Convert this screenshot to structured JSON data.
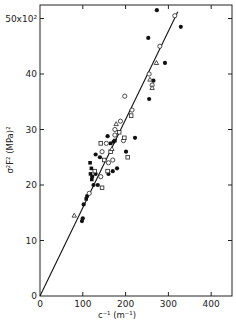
{
  "chart_data": {
    "type": "scatter",
    "title": "",
    "xlabel": "c⁻¹  (m⁻¹)",
    "ylabel": "σ²F²  (MPa)²",
    "y_multiplier_label": "50×10²",
    "xlim": [
      0,
      450
    ],
    "ylim": [
      0,
      52
    ],
    "x_ticks": [
      0,
      100,
      200,
      300,
      400
    ],
    "y_ticks": [
      0,
      10,
      20,
      30,
      40,
      50
    ],
    "x_tick_labels": [
      "0",
      "100",
      "200",
      "300",
      "400"
    ],
    "y_tick_labels": [
      "0",
      "10",
      "20",
      "30",
      "40",
      "50x10²"
    ],
    "grid": false,
    "legend": null,
    "fit_line": {
      "x": [
        0,
        322
      ],
      "y": [
        0,
        51.2
      ]
    },
    "series": [
      {
        "name": "filled circles",
        "marker": "filled-circle",
        "points": [
          [
            273,
            51.5
          ],
          [
            329,
            48.5
          ],
          [
            253,
            46.5
          ],
          [
            292,
            42.0
          ],
          [
            255,
            35.5
          ],
          [
            265,
            38.8
          ],
          [
            222,
            28.5
          ],
          [
            201,
            26.0
          ],
          [
            180,
            23.0
          ],
          [
            170,
            22.5
          ],
          [
            130,
            25.5
          ],
          [
            140,
            25.0
          ],
          [
            130,
            22.0
          ],
          [
            125,
            20.0
          ],
          [
            100,
            14.0
          ],
          [
            102,
            16.5
          ],
          [
            110,
            18.0
          ],
          [
            158,
            28.8
          ],
          [
            172,
            27.8
          ],
          [
            160,
            22.0
          ],
          [
            122,
            21.5
          ],
          [
            135,
            20.0
          ],
          [
            98,
            13.5
          ]
        ]
      },
      {
        "name": "filled squares",
        "marker": "filled-square",
        "points": [
          [
            120,
            23.0
          ],
          [
            118,
            22.0
          ],
          [
            121,
            21.0
          ],
          [
            117,
            24.0
          ],
          [
            175,
            28.0
          ],
          [
            165,
            27.5
          ],
          [
            108,
            17.5
          ]
        ]
      },
      {
        "name": "open circles",
        "marker": "open-circle",
        "points": [
          [
            315,
            50.5
          ],
          [
            280,
            45.0
          ],
          [
            255,
            40.0
          ],
          [
            262,
            38.0
          ],
          [
            198,
            36.0
          ],
          [
            215,
            33.5
          ],
          [
            188,
            31.5
          ],
          [
            175,
            30.0
          ],
          [
            155,
            27.5
          ],
          [
            145,
            26.0
          ],
          [
            175,
            29.0
          ],
          [
            195,
            28.0
          ],
          [
            142,
            21.5
          ],
          [
            160,
            24.0
          ],
          [
            170,
            24.5
          ],
          [
            115,
            18.5
          ]
        ]
      },
      {
        "name": "open squares",
        "marker": "open-square",
        "points": [
          [
            213,
            32.5
          ],
          [
            185,
            29.5
          ],
          [
            197,
            28.5
          ],
          [
            165,
            26.0
          ],
          [
            150,
            24.5
          ],
          [
            205,
            25.0
          ],
          [
            142,
            27.5
          ],
          [
            128,
            22.5
          ],
          [
            145,
            19.5
          ],
          [
            158,
            22.5
          ]
        ]
      },
      {
        "name": "open triangles",
        "marker": "open-triangle",
        "points": [
          [
            272,
            42.0
          ],
          [
            262,
            37.5
          ],
          [
            257,
            39.0
          ],
          [
            178,
            31.0
          ],
          [
            80,
            14.5
          ],
          [
            168,
            26.5
          ]
        ]
      }
    ]
  }
}
